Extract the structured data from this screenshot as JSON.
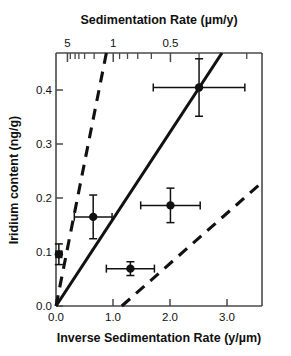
{
  "chart_data": {
    "type": "scatter",
    "title": "",
    "xlabel": "Inverse Sedimentation Rate (y/µm)",
    "ylabel": "Iridium content (ng/g)",
    "x2label": "Sedimentation Rate (µm/y)",
    "xlim": [
      0.0,
      3.6
    ],
    "ylim": [
      0.0,
      0.44
    ],
    "grid": false,
    "legend": null,
    "xticks": [
      0.0,
      1.0,
      2.0,
      3.0
    ],
    "xtick_labels": [
      "0.0",
      "1.0",
      "2.0",
      "3.0"
    ],
    "yticks": [
      0.0,
      0.1,
      0.2,
      0.3,
      0.4
    ],
    "ytick_labels": [
      "0.0",
      "0.1",
      "0.2",
      "0.3",
      "0.4"
    ],
    "x2ticks": [
      5,
      1,
      0.5
    ],
    "x2tick_labels": [
      "5",
      "1",
      "0.5"
    ],
    "x2_scale": "reciprocal",
    "x2_minor_ticks": [
      5,
      4,
      3,
      2.5,
      2,
      1.5,
      1,
      0.9,
      0.8,
      0.7,
      0.6,
      0.5,
      0.4,
      0.3
    ],
    "points": [
      {
        "x": 0.05,
        "y": 0.09,
        "xerr": 0.05,
        "yerr": 0.018
      },
      {
        "x": 0.65,
        "y": 0.155,
        "xerr": 0.33,
        "yerr": 0.038
      },
      {
        "x": 1.3,
        "y": 0.065,
        "xerr": 0.42,
        "yerr": 0.012
      },
      {
        "x": 2.0,
        "y": 0.175,
        "xerr": 0.52,
        "yerr": 0.03
      },
      {
        "x": 2.5,
        "y": 0.38,
        "xerr": 0.8,
        "yerr": 0.05
      }
    ],
    "lines": [
      {
        "name": "best-fit",
        "style": "solid",
        "x0": 0.0,
        "y0": 0.0,
        "x1": 2.9,
        "y1": 0.44
      },
      {
        "name": "upper-bound",
        "style": "dashed",
        "x0": 0.0,
        "y0": 0.0,
        "x1": 0.88,
        "y1": 0.44
      },
      {
        "name": "lower-bound",
        "style": "dashed",
        "x0": 1.15,
        "y0": 0.0,
        "x1": 3.6,
        "y1": 0.215
      }
    ]
  }
}
